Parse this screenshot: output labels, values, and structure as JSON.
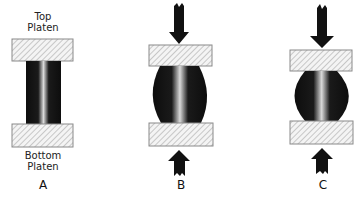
{
  "diagram": {
    "type": "compression-test-illustration",
    "panels": [
      {
        "id": "A",
        "label": "A",
        "top_platen_label": [
          "Top",
          "Platen"
        ],
        "bottom_platen_label": [
          "Bottom",
          "Platen"
        ],
        "specimen_shape": "straight cylinder",
        "arrows": false
      },
      {
        "id": "B",
        "label": "B",
        "specimen_shape": "barrelled",
        "arrows": true
      },
      {
        "id": "C",
        "label": "C",
        "specimen_shape": "strongly barrelled",
        "arrows": true
      }
    ]
  },
  "labels": {
    "top_line1": "Top",
    "top_line2": "Platen",
    "bottom_line1": "Bottom",
    "bottom_line2": "Platen",
    "panel_a": "A",
    "panel_b": "B",
    "panel_c": "C"
  },
  "colors": {
    "specimen": "#0d0d0d",
    "specimen_streak": "#e6e6e6",
    "platen_hatch": "#9a9a9a",
    "platen_border": "#8a8a8a",
    "arrow": "#111111"
  }
}
